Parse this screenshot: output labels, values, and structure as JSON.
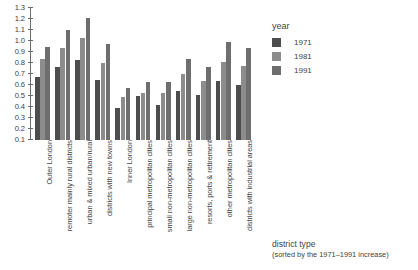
{
  "chart_data": {
    "type": "bar",
    "title": "",
    "xlabel": "district type",
    "xlabel_note": "(sorted by the 1971–1991 increase)",
    "ylabel": "",
    "ylim": [
      0.1,
      1.3
    ],
    "yticks": [
      "0.1",
      "0.2",
      "0.3",
      "0.4",
      "0.5",
      "0.6",
      "0.7",
      "0.8",
      "0.9",
      "1.0",
      "1.1",
      "1.2",
      "1.3"
    ],
    "grid": false,
    "legend_title": "year",
    "legend_position": "right",
    "categories": [
      "Outer London",
      "remoter mainly rural districts",
      "urban & mixed urban/rural",
      "districts with new towns",
      "Inner London",
      "principal metropolitan cities",
      "small non-metropolitan cities",
      "large non-metropolitan cities",
      "resorts, ports & retirement",
      "other metropolitan cities",
      "districts with industrial areas"
    ],
    "series": [
      {
        "name": "1971",
        "color": "#4d4d4d",
        "values": [
          0.67,
          0.76,
          0.83,
          0.65,
          0.39,
          0.5,
          0.42,
          0.55,
          0.51,
          0.64,
          0.6
        ]
      },
      {
        "name": "1981",
        "color": "#8c8c8c",
        "values": [
          0.84,
          0.94,
          1.03,
          0.8,
          0.49,
          0.53,
          0.53,
          0.7,
          0.64,
          0.81,
          0.77
        ]
      },
      {
        "name": "1991",
        "color": "#6e6e6e",
        "values": [
          0.95,
          1.1,
          1.21,
          0.97,
          0.57,
          0.63,
          0.63,
          0.84,
          0.76,
          0.99,
          0.94
        ]
      }
    ]
  },
  "legend": {
    "title": "year",
    "entries": [
      {
        "label": "1971",
        "color": "#4d4d4d"
      },
      {
        "label": "1981",
        "color": "#8c8c8c"
      },
      {
        "label": "1991",
        "color": "#6e6e6e"
      }
    ]
  },
  "axis": {
    "x_title": "district type",
    "x_subtitle": "(sorted by the 1971–1991 increase)"
  }
}
